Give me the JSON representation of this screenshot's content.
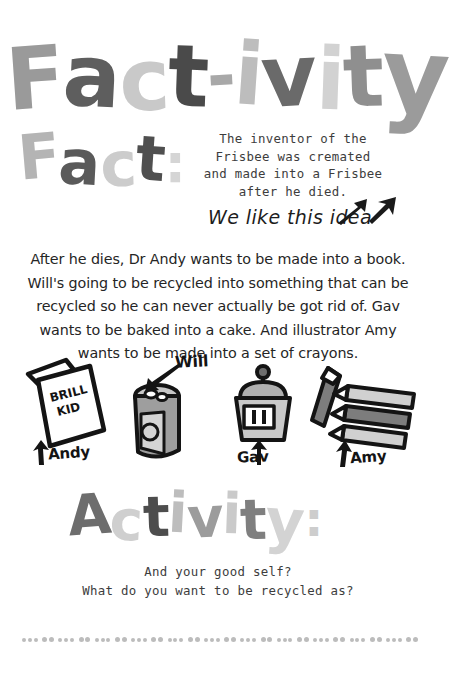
{
  "title": {
    "main": "Fact-ivity",
    "main_letters": [
      "F",
      "a",
      "c",
      "t",
      "-",
      "i",
      "v",
      "i",
      "t",
      "y"
    ],
    "fact_heading": "Fact:",
    "fact_heading_letters": [
      "F",
      "a",
      "c",
      "t",
      ":"
    ],
    "activity_heading": "Activity:",
    "activity_heading_letters": [
      "A",
      "c",
      "t",
      "i",
      "v",
      "i",
      "t",
      "y",
      ":"
    ]
  },
  "fact": {
    "lines": [
      "The inventor of the",
      "Frisbee was cremated",
      "and made into a Frisbee",
      "after he died."
    ],
    "full_text": "The inventor of the Frisbee was cremated and made into a Frisbee after he died.",
    "annotation": "We like this idea"
  },
  "body": {
    "paragraph": "After he dies, Dr Andy wants to be made into a book. Will's going to be recycled into something that can be recycled so he can never actually be got rid of. Gav wants to be baked into a cake. And illustrator Amy wants to be made into a set of crayons."
  },
  "illustrations": [
    {
      "name": "book",
      "label": "Andy",
      "cover_text_line1": "BRILL",
      "cover_text_line2": "KID"
    },
    {
      "name": "can",
      "label": "Will"
    },
    {
      "name": "cupcake",
      "label": "Gav"
    },
    {
      "name": "crayons",
      "label": "Amy"
    }
  ],
  "activity": {
    "question_line1": "And your good self?",
    "question_line2": "What do you want to be recycled as?"
  },
  "colors": {
    "background": "#ffffff",
    "ink": "#1d1d1d",
    "typewriter_ink": "#3d3d3d",
    "heading_dark": "#4d4d4d",
    "heading_mid": "#9a9a9a",
    "heading_light": "#cfcfcf",
    "illustration_fill_dark": "#8c8c8c",
    "illustration_fill_light": "#c6c6c6",
    "divider_dot": "#bcbcbc"
  },
  "divider": {
    "dot_count": 60
  }
}
